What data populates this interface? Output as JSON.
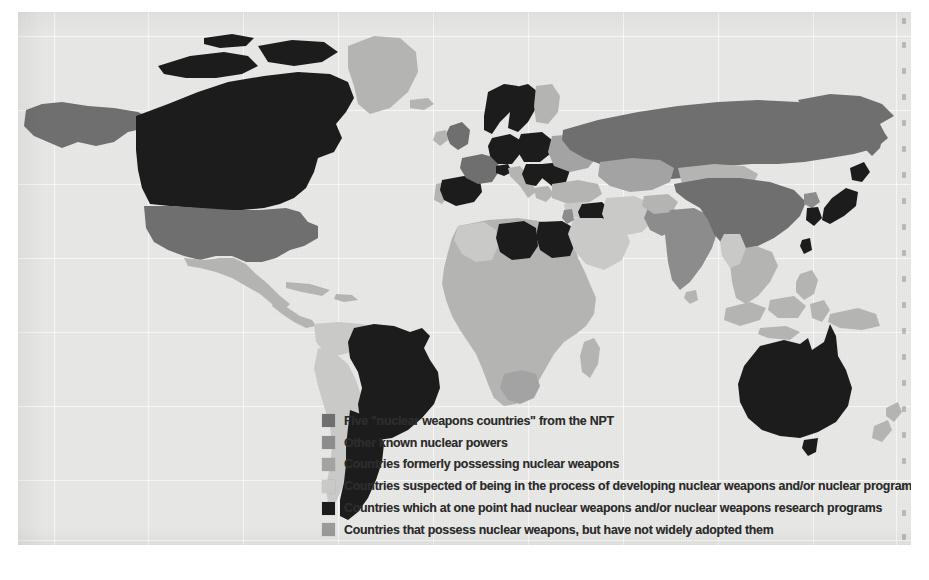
{
  "figure": {
    "kind": "thematic-world-map",
    "background_color": "#e9e9e7"
  },
  "palette": {
    "npt_five": "#6f6f6f",
    "other_known": "#8c8c8c",
    "formerly_possessing": "#a3a3a3",
    "suspected_developing": "#c9c9c7",
    "had_programs": "#1c1c1c",
    "possess_not_adopted": "#9a9a9a",
    "base_land": "#b4b4b2",
    "ocean": "#e9e9e7",
    "border": "#e9e9e7",
    "label_text": "#2b2b2b"
  },
  "legend": {
    "items": [
      {
        "swatch_color": "#6f6f6f",
        "label": "Five \"nuclear weapons countries\" from the NPT"
      },
      {
        "swatch_color": "#8c8c8c",
        "label": "Other known nuclear powers"
      },
      {
        "swatch_color": "#a3a3a3",
        "label": "Countries formerly possessing nuclear weapons"
      },
      {
        "swatch_color": "#c9c9c7",
        "label": "Countries suspected of being in the process of developing nuclear weapons and/or nuclear programs"
      },
      {
        "swatch_color": "#1c1c1c",
        "label": "Countries which at one point had nuclear weapons and/or nuclear weapons research programs"
      },
      {
        "swatch_color": "#9a9a9a",
        "label": "Countries that possess nuclear weapons, but have not widely adopted them"
      }
    ]
  },
  "map_regions": {
    "npt_five": [
      "United States",
      "Russia",
      "China",
      "United Kingdom",
      "France"
    ],
    "other_known": [
      "India",
      "Pakistan",
      "Israel",
      "North Korea"
    ],
    "formerly_possessing": [
      "Ukraine",
      "Belarus",
      "Kazakhstan",
      "South Africa"
    ],
    "suspected_developing": [
      "Iran",
      "Syria",
      "Saudi Arabia",
      "Algeria",
      "Myanmar"
    ],
    "had_programs": [
      "Canada",
      "Brazil",
      "Argentina",
      "Australia",
      "Japan",
      "South Korea",
      "Sweden",
      "Norway",
      "Germany",
      "Poland",
      "Spain",
      "Romania",
      "Yugoslavia",
      "Libya",
      "Egypt",
      "Iraq",
      "Taiwan",
      "Switzerland"
    ]
  }
}
